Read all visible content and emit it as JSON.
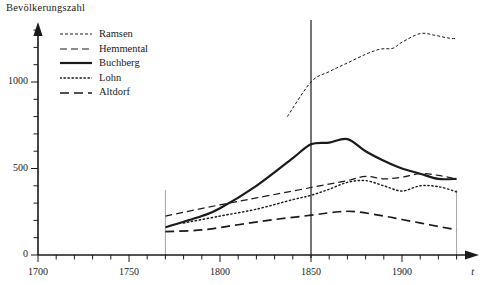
{
  "axes": {
    "y_title": "Bevölkerungszahl",
    "x_var": "t",
    "y_ticks": [
      "0",
      "500",
      "1000"
    ],
    "x_ticks": [
      "1700",
      "1750",
      "1800",
      "1850",
      "1900"
    ]
  },
  "legend": {
    "items": [
      {
        "label": "Ramsen",
        "style": "fine-dash",
        "color": "#1a1a1a"
      },
      {
        "label": "Hemmental",
        "style": "dash",
        "color": "#1a1a1a"
      },
      {
        "label": "Buchberg",
        "style": "solid",
        "color": "#1a1a1a"
      },
      {
        "label": "Lohn",
        "style": "dot",
        "color": "#1a1a1a"
      },
      {
        "label": "Altdorf",
        "style": "long-dash",
        "color": "#1a1a1a"
      }
    ]
  },
  "chart_data": {
    "type": "line",
    "title": "",
    "xlabel": "t",
    "ylabel": "Bevölkerungszahl",
    "xlim": [
      1700,
      1935
    ],
    "ylim": [
      0,
      1300
    ],
    "grid": false,
    "legend_position": "top-left",
    "x_tick_values": [
      1700,
      1750,
      1800,
      1850,
      1900
    ],
    "y_tick_values": [
      0,
      500,
      1000
    ],
    "x_minor_tick_step": 10,
    "y_minor_tick_step": 100,
    "reference_lines": [
      {
        "x": 1770,
        "weight": "light"
      },
      {
        "x": 1850,
        "weight": "heavy"
      },
      {
        "x": 1930,
        "weight": "light"
      }
    ],
    "series": [
      {
        "name": "Ramsen",
        "style": "fine-dash",
        "x": [
          1837,
          1850,
          1860,
          1870,
          1880,
          1888,
          1895,
          1900,
          1910,
          1918,
          1925,
          1930
        ],
        "values": [
          800,
          1000,
          1060,
          1110,
          1160,
          1190,
          1195,
          1230,
          1280,
          1270,
          1255,
          1250
        ]
      },
      {
        "name": "Hemmental",
        "style": "dash",
        "x": [
          1770,
          1800,
          1820,
          1850,
          1870,
          1880,
          1890,
          1900,
          1910,
          1920,
          1930
        ],
        "values": [
          225,
          290,
          330,
          390,
          430,
          455,
          440,
          450,
          470,
          460,
          440
        ]
      },
      {
        "name": "Buchberg",
        "style": "solid",
        "x": [
          1770,
          1790,
          1800,
          1820,
          1840,
          1850,
          1860,
          1870,
          1880,
          1890,
          1900,
          1910,
          1920,
          1930
        ],
        "values": [
          160,
          225,
          270,
          400,
          560,
          640,
          650,
          670,
          600,
          545,
          500,
          470,
          440,
          440
        ]
      },
      {
        "name": "Lohn",
        "style": "dot",
        "x": [
          1780,
          1800,
          1820,
          1840,
          1850,
          1860,
          1870,
          1880,
          1890,
          1900,
          1910,
          1920,
          1930
        ],
        "values": [
          185,
          225,
          265,
          320,
          345,
          380,
          420,
          430,
          400,
          370,
          400,
          395,
          365
        ]
      },
      {
        "name": "Altdorf",
        "style": "long-dash",
        "x": [
          1770,
          1790,
          1810,
          1830,
          1850,
          1865,
          1875,
          1890,
          1900,
          1915,
          1930
        ],
        "values": [
          135,
          145,
          175,
          205,
          230,
          250,
          250,
          225,
          205,
          175,
          145
        ]
      }
    ]
  }
}
